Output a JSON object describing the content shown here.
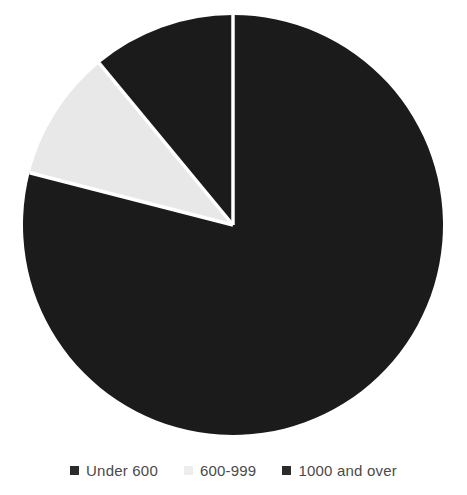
{
  "chart_data": {
    "type": "pie",
    "title": "",
    "subtitle": "",
    "xlabel": "",
    "ylabel": "",
    "grid": false,
    "legend_position": "bottom",
    "start_angle_deg": 0,
    "direction": "clockwise",
    "categories": [
      "Under 600",
      "600-999",
      "1000 and over"
    ],
    "values": [
      79,
      10,
      11
    ],
    "units": "percent",
    "slices": [
      {
        "label": "Under 600",
        "value": 79,
        "percent": 79,
        "color": "#1b1b1b",
        "start_angle_deg": 0,
        "end_angle_deg": 284.4
      },
      {
        "label": "600-999",
        "value": 10,
        "percent": 10,
        "color": "#e8e8e8",
        "start_angle_deg": 284.4,
        "end_angle_deg": 320.4
      },
      {
        "label": "1000 and over",
        "value": 11,
        "percent": 11,
        "color": "#1b1b1b",
        "start_angle_deg": 320.4,
        "end_angle_deg": 360
      }
    ],
    "colors": [
      "#1b1b1b",
      "#e8e8e8",
      "#1b1b1b"
    ],
    "separator_color": "#ffffff",
    "background_color": "#ffffff"
  },
  "legend": {
    "items": [
      {
        "label": "Under 600",
        "swatch_color": "#2b2b2b"
      },
      {
        "label": "600-999",
        "swatch_color": "#ededed"
      },
      {
        "label": "1000 and over",
        "swatch_color": "#2b2b2b"
      }
    ]
  },
  "geometry": {
    "center_x": 233,
    "center_y": 225,
    "radius": 210
  }
}
